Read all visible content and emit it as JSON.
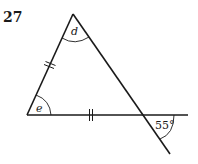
{
  "question_number": "27",
  "figure": {
    "type": "triangle-with-transversal",
    "angle_labels": {
      "apex": "d",
      "bottom_left": "e",
      "exterior": "55°"
    },
    "equal_sides": [
      "left-side",
      "base"
    ],
    "colors": {
      "stroke": "#1a1a1a",
      "background": "#ffffff"
    }
  }
}
